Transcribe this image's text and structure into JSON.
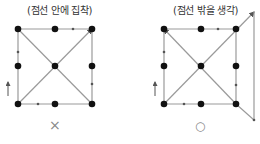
{
  "panels": [
    {
      "caption": "(점선 안에 집착)",
      "verdict": "×",
      "verdict_meaning": "wrong"
    },
    {
      "caption": "(점선 밖을 생각)",
      "verdict": "○",
      "verdict_meaning": "correct"
    }
  ],
  "colors": {
    "dot": "#111111",
    "line": "#9a9a9a",
    "arrow": "#555555",
    "text": "#333333"
  }
}
